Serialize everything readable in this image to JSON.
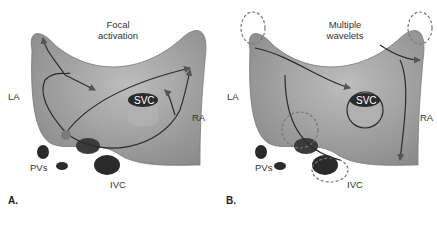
{
  "panels": [
    {
      "id": "A",
      "panel_label": "A.",
      "title_line1": "Focal",
      "title_line2": "activation",
      "labels": {
        "la": "LA",
        "ra": "RA",
        "svc": "SVC",
        "ivc": "IVC",
        "pvs": "PVs"
      }
    },
    {
      "id": "B",
      "panel_label": "B.",
      "title_line1": "Multiple",
      "title_line2": "wavelets",
      "labels": {
        "la": "LA",
        "ra": "RA",
        "svc": "SVC",
        "ivc": "IVC",
        "pvs": "PVs"
      }
    }
  ],
  "colors": {
    "atria_fill": "#9a9a9a",
    "atria_highlight": "#b8b8b8",
    "vessel_dark": "#2a2a2a",
    "path_line": "#2b2b2b",
    "focus_dot": "#7a7a7a",
    "dashed_line": "#777777"
  }
}
